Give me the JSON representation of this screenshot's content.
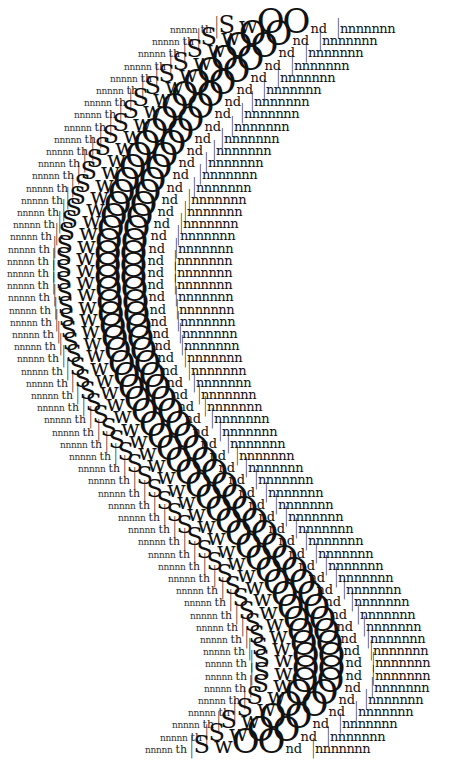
{
  "artwork": {
    "title": "",
    "row_text": {
      "lead": "nnnnn",
      "th": "th",
      "bar": "|",
      "S": "S",
      "w": "w",
      "OO": "OO",
      "nd": "nd",
      "bar2": "|",
      "tail": "nnnnnnn"
    },
    "ink_color": "#111111",
    "background": "#ffffff",
    "row_spacing_px": 12.2,
    "first_row_y": 4,
    "row_x_offsets": [
      170,
      152,
      138,
      124,
      110,
      96,
      84,
      74,
      64,
      54,
      46,
      38,
      32,
      26,
      21,
      17,
      13,
      10,
      8,
      7,
      7,
      7,
      8,
      9,
      10,
      12,
      14,
      17,
      21,
      26,
      31,
      37,
      44,
      52,
      60,
      69,
      78,
      88,
      98,
      108,
      118,
      128,
      138,
      148,
      158,
      168,
      176,
      184,
      190,
      196,
      200,
      203,
      205,
      205,
      204,
      198,
      188,
      172,
      160,
      145
    ]
  }
}
